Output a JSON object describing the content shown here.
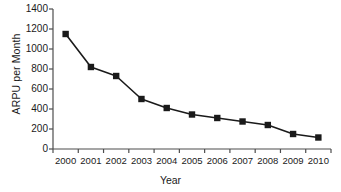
{
  "chart_data": {
    "type": "line",
    "title": "",
    "xlabel": "Year",
    "ylabel": "ARPU per Month",
    "categories": [
      "2000",
      "2001",
      "2002",
      "2003",
      "2004",
      "2005",
      "2006",
      "2007",
      "2008",
      "2009",
      "2010"
    ],
    "values": [
      1150,
      820,
      730,
      500,
      410,
      345,
      310,
      275,
      240,
      150,
      115
    ],
    "series": [
      {
        "name": "ARPU per Month",
        "values": [
          1150,
          820,
          730,
          500,
          410,
          345,
          310,
          275,
          240,
          150,
          115
        ]
      }
    ],
    "ylim": [
      0,
      1400
    ],
    "ytick_labels": [
      "0",
      "200",
      "400",
      "600",
      "800",
      "1000",
      "1200",
      "1400"
    ],
    "ytick_values": [
      0,
      200,
      400,
      600,
      800,
      1000,
      1200,
      1400
    ],
    "grid": false,
    "legend": "none",
    "marker": "square",
    "line_color": "#1a1a1a",
    "marker_color": "#1a1a1a",
    "axis_color": "#4d4d4d",
    "background_color": "#ffffff"
  },
  "axis": {
    "y_title": "ARPU per Month",
    "x_title": "Year"
  }
}
